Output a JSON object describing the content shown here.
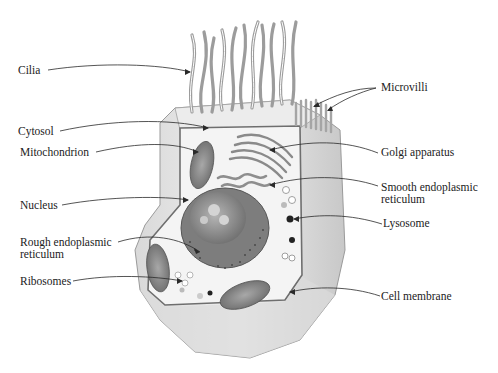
{
  "diagram": {
    "labels": {
      "left": [
        {
          "id": "cilia",
          "text": "Cilia"
        },
        {
          "id": "cytosol",
          "text": "Cytosol"
        },
        {
          "id": "mitochondrion",
          "text": "Mitochondrion"
        },
        {
          "id": "nucleus",
          "text": "Nucleus"
        },
        {
          "id": "rough_er_1",
          "text": "Rough endoplasmic"
        },
        {
          "id": "rough_er_2",
          "text": "reticulum"
        },
        {
          "id": "ribosomes",
          "text": "Ribosomes"
        }
      ],
      "right": [
        {
          "id": "microvilli",
          "text": "Microvilli"
        },
        {
          "id": "golgi",
          "text": "Golgi apparatus"
        },
        {
          "id": "smooth_er_1",
          "text": "Smooth endoplasmic"
        },
        {
          "id": "smooth_er_2",
          "text": "reticulum"
        },
        {
          "id": "lysosome",
          "text": "Lysosome"
        },
        {
          "id": "cell_membrane",
          "text": "Cell membrane"
        }
      ]
    },
    "colors": {
      "background": "#ffffff",
      "cell_fill": "#e4e4e4",
      "cell_shade": "#cfcfcf",
      "membrane": "#7a7a7a",
      "nucleus": "#8c8c8c",
      "organelle": "#9a9a9a",
      "text": "#222222"
    }
  }
}
